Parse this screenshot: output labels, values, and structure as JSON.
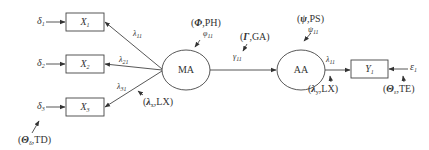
{
  "diagram": {
    "type": "structural-equation-model",
    "observed_x": [
      {
        "id": "X1",
        "label": "X",
        "sub": "1",
        "error": "δ",
        "error_sub": "1",
        "loading": "λ",
        "loading_sub": "11"
      },
      {
        "id": "X2",
        "label": "X",
        "sub": "2",
        "error": "δ",
        "error_sub": "2",
        "loading": "λ",
        "loading_sub": "21"
      },
      {
        "id": "X3",
        "label": "X",
        "sub": "3",
        "error": "δ",
        "error_sub": "3",
        "loading": "λ",
        "loading_sub": "31"
      }
    ],
    "latent": [
      {
        "id": "MA",
        "label": "MA"
      },
      {
        "id": "AA",
        "label": "AA"
      }
    ],
    "observed_y": [
      {
        "id": "Y1",
        "label": "Y",
        "sub": "1",
        "error": "ε",
        "error_sub": "1",
        "loading": "λ",
        "loading_sub": "11"
      }
    ],
    "paths": {
      "gamma": {
        "symbol": "γ",
        "sub": "11"
      },
      "phi": {
        "symbol": "φ",
        "sub": "11"
      },
      "psi": {
        "symbol": "ψ",
        "sub": "11"
      }
    },
    "matrix_annotations": {
      "phi": {
        "symbol": "Φ",
        "text": ",PH"
      },
      "gamma": {
        "symbol": "Γ",
        "text": ",GA"
      },
      "psi": {
        "symbol": "ψ",
        "text": ",PS"
      },
      "lambda_x": {
        "symbol": "λ",
        "sub": "x",
        "text": ",LX"
      },
      "lambda_y": {
        "symbol": "λ",
        "sub": "y",
        "text": ",LX"
      },
      "theta_delta": {
        "symbol": "Θ",
        "sub": "δ",
        "text": ",TD"
      },
      "theta_eps": {
        "symbol": "Θ",
        "sub": "ε",
        "text": ",TE"
      }
    }
  }
}
